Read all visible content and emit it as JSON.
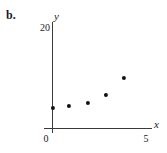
{
  "figure": {
    "part_label": "b."
  },
  "chart_data": {
    "type": "scatter",
    "title": "",
    "subtitle": "",
    "xlabel": "x",
    "ylabel": "y",
    "xlim": [
      0,
      5
    ],
    "ylim": [
      0,
      20
    ],
    "xticks": [
      "0",
      "5"
    ],
    "yticks": [
      "20"
    ],
    "grid": false,
    "legend": null,
    "marker": "filled-circle",
    "marker_color": "#111111",
    "axis_color": "#3a3a3a",
    "points": [
      {
        "x": 0.0,
        "y": 3.9
      },
      {
        "x": 0.86,
        "y": 4.3
      },
      {
        "x": 1.9,
        "y": 4.9
      },
      {
        "x": 2.85,
        "y": 6.4
      },
      {
        "x": 3.8,
        "y": 9.7
      }
    ],
    "series": [
      {
        "name": "",
        "x": [
          0.0,
          0.86,
          1.9,
          2.85,
          3.8
        ],
        "values": [
          3.9,
          4.3,
          4.9,
          6.4,
          9.7
        ]
      }
    ]
  }
}
